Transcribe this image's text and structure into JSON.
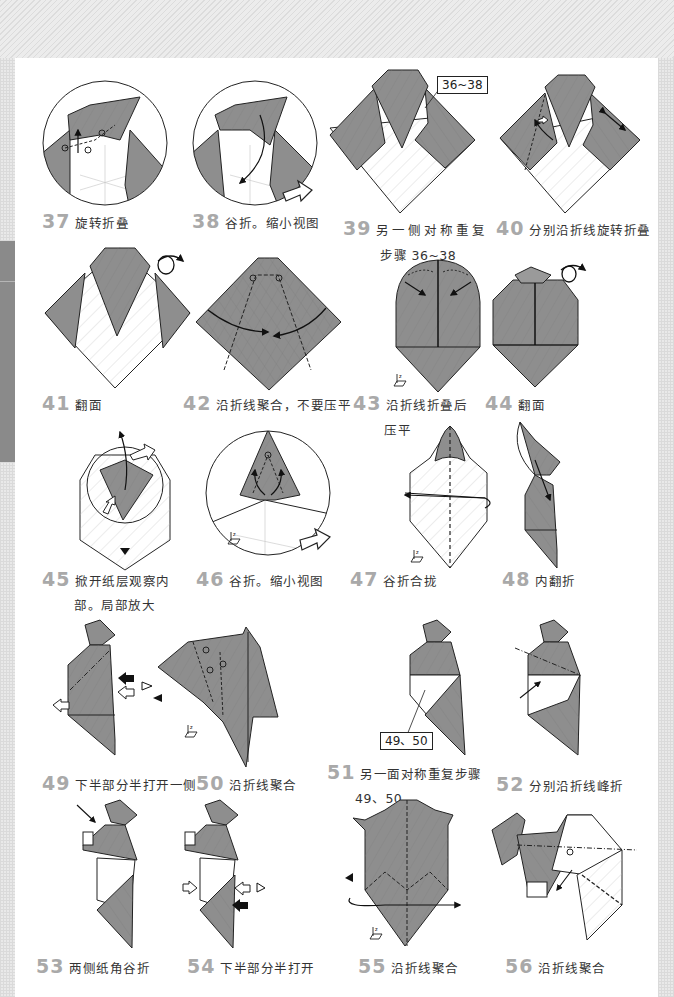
{
  "page": {
    "background_color": "#ececec",
    "paper_color": "#ffffff",
    "fold_gray": "#8c8c8c",
    "step_number_color": "#a9a9a9",
    "chapter_tab_color": "#8a8a8a"
  },
  "steps": [
    {
      "num": "37",
      "text": "旋转折叠"
    },
    {
      "num": "38",
      "text": "谷折。缩小视图"
    },
    {
      "num": "39",
      "text": "另一侧对称重复",
      "text2": "步骤 36~38",
      "ref": "36~38"
    },
    {
      "num": "40",
      "text": "分别沿折线旋转折叠"
    },
    {
      "num": "41",
      "text": "翻面"
    },
    {
      "num": "42",
      "text": "沿折线聚合，不要压平"
    },
    {
      "num": "43",
      "text": "沿折线折叠后",
      "text2": "压平"
    },
    {
      "num": "44",
      "text": "翻面"
    },
    {
      "num": "45",
      "text": "掀开纸层观察内",
      "text2": "部。局部放大"
    },
    {
      "num": "46",
      "text": "谷折。缩小视图"
    },
    {
      "num": "47",
      "text": "谷折合拢"
    },
    {
      "num": "48",
      "text": "内翻折"
    },
    {
      "num": "49",
      "text": "下半部分半打开一侧"
    },
    {
      "num": "50",
      "text": "沿折线聚合"
    },
    {
      "num": "51",
      "text": "另一面对称重复步骤",
      "text2": "49、50",
      "ref": "49、50"
    },
    {
      "num": "52",
      "text": "分别沿折线峰折"
    },
    {
      "num": "53",
      "text": "两侧纸角谷折"
    },
    {
      "num": "54",
      "text": "下半部分半打开"
    },
    {
      "num": "55",
      "text": "沿折线聚合"
    },
    {
      "num": "56",
      "text": "沿折线聚合"
    }
  ],
  "icons": {
    "turn_over": "turn-over-icon",
    "view_eye": "eye-view-icon",
    "push_arrow": "push-arrow-icon",
    "axis_z": "axis-z-icon",
    "zoom_out": "zoom-out-arrow-icon"
  }
}
